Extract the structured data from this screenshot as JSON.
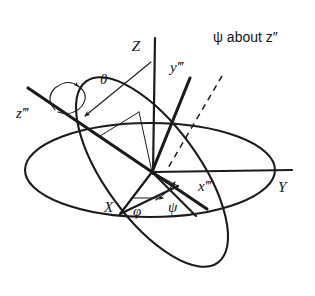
{
  "figure": {
    "type": "euler-angle-rotation-diagram",
    "background_color": "#ffffff",
    "line_color": "#1b1b1b",
    "caption_top_right": "ψ about z″"
  },
  "labels": {
    "z_triple_prime": "z‴",
    "theta": "θ",
    "Z": "Z",
    "y_triple_prime": "y‴",
    "psi_about_z": "ψ about z″",
    "X": "X",
    "phi": "φ",
    "psi": "ψ",
    "x_triple_prime": "x‴",
    "Y": "Y"
  },
  "axes": [
    {
      "name": "Z",
      "label": "Z",
      "description": "vertical axis up from origin"
    },
    {
      "name": "Y",
      "label": "Y",
      "description": "horizontal axis right from origin"
    },
    {
      "name": "X",
      "label": "X",
      "description": "in-plane axis toward lower-left"
    },
    {
      "name": "z-triple-prime",
      "label": "z‴",
      "description": "tilted body axis toward upper-left"
    },
    {
      "name": "x-triple-prime",
      "label": "x‴",
      "description": "body axis toward lower-right"
    },
    {
      "name": "y-triple-prime",
      "label": "y‴",
      "description": "body axis toward upper-right"
    }
  ],
  "angles": [
    {
      "name": "theta",
      "label": "θ",
      "description": "arc from Z axis to z‴ axis, arrow at z‴ end"
    },
    {
      "name": "phi",
      "label": "φ",
      "description": "in-plane angle from X, straight arrow pointing right"
    },
    {
      "name": "psi",
      "label": "ψ",
      "description": "angle with arrow pointing up-right near origin"
    },
    {
      "name": "psi-rotation",
      "label": "ψ about z″",
      "description": "rotation caption at top right"
    }
  ],
  "planes": [
    {
      "name": "horizontal-plane",
      "description": "large flat ellipse representing the XY plane"
    },
    {
      "name": "tilted-plane",
      "description": "tilted ellipse representing the rotated body plane"
    }
  ],
  "rotation_markers": [
    {
      "name": "z-triple-prime-spin-arrow",
      "description": "curved double arrow wrapping the z‴ axis"
    }
  ]
}
